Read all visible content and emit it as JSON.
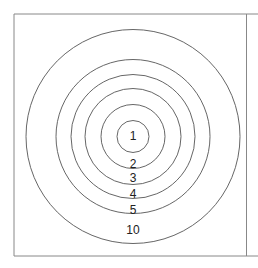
{
  "diagram": {
    "type": "concentric-circles",
    "center": {
      "x": 133,
      "y": 136.5
    },
    "stroke_color": "#555555",
    "frame_color": "#777777",
    "rings": [
      {
        "label": "1",
        "radius": 16,
        "label_y": 140
      },
      {
        "label": "2",
        "radius": 32,
        "label_y": 168
      },
      {
        "label": "3",
        "radius": 48,
        "label_y": 182
      },
      {
        "label": "4",
        "radius": 62,
        "label_y": 198
      },
      {
        "label": "5",
        "radius": 77,
        "label_y": 214
      },
      {
        "label": "10",
        "radius": 107,
        "label_y": 234
      }
    ]
  }
}
